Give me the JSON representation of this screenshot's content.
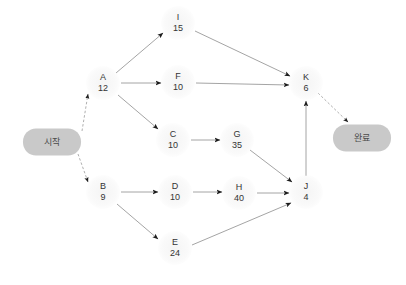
{
  "diagram": {
    "canvas": {
      "width": 406,
      "height": 285,
      "background": "#ffffff"
    },
    "style": {
      "node_fill": "#f4f4f4",
      "terminal_fill": "#c9c9c9",
      "edge_color": "#9a9a9a",
      "arrow_color": "#1a1a1a",
      "text_color": "#343434"
    },
    "start": {
      "id": "start",
      "label": "시작",
      "x": 52,
      "y": 142
    },
    "end": {
      "id": "end",
      "label": "완료",
      "x": 362,
      "y": 138
    },
    "nodes": [
      {
        "id": "A",
        "name": "A",
        "duration": "12",
        "x": 103,
        "y": 83
      },
      {
        "id": "B",
        "name": "B",
        "duration": "9",
        "x": 103,
        "y": 192
      },
      {
        "id": "C",
        "name": "C",
        "duration": "10",
        "x": 173,
        "y": 140
      },
      {
        "id": "D",
        "name": "D",
        "duration": "10",
        "x": 175,
        "y": 192
      },
      {
        "id": "E",
        "name": "E",
        "duration": "24",
        "x": 175,
        "y": 248
      },
      {
        "id": "F",
        "name": "F",
        "duration": "10",
        "x": 178,
        "y": 82
      },
      {
        "id": "G",
        "name": "G",
        "duration": "35",
        "x": 237,
        "y": 140
      },
      {
        "id": "H",
        "name": "H",
        "duration": "40",
        "x": 239,
        "y": 193
      },
      {
        "id": "I",
        "name": "I",
        "duration": "15",
        "x": 178,
        "y": 23
      },
      {
        "id": "J",
        "name": "J",
        "duration": "4",
        "x": 306,
        "y": 192
      },
      {
        "id": "K",
        "name": "K",
        "duration": "6",
        "x": 306,
        "y": 83
      }
    ],
    "edges": [
      {
        "from": "start",
        "to": "A",
        "x1": 82,
        "y1": 131,
        "x2": 88,
        "y2": 94,
        "dashed": true
      },
      {
        "from": "start",
        "to": "B",
        "x1": 78,
        "y1": 154,
        "x2": 88,
        "y2": 182,
        "dashed": true
      },
      {
        "from": "A",
        "to": "I",
        "x1": 116,
        "y1": 73,
        "x2": 163,
        "y2": 33
      },
      {
        "from": "A",
        "to": "F",
        "x1": 121,
        "y1": 83,
        "x2": 161,
        "y2": 83
      },
      {
        "from": "A",
        "to": "C",
        "x1": 118,
        "y1": 95,
        "x2": 158,
        "y2": 129
      },
      {
        "from": "B",
        "to": "D",
        "x1": 121,
        "y1": 192,
        "x2": 158,
        "y2": 192
      },
      {
        "from": "B",
        "to": "E",
        "x1": 117,
        "y1": 204,
        "x2": 158,
        "y2": 239
      },
      {
        "from": "C",
        "to": "G",
        "x1": 191,
        "y1": 140,
        "x2": 220,
        "y2": 140
      },
      {
        "from": "D",
        "to": "H",
        "x1": 193,
        "y1": 192,
        "x2": 222,
        "y2": 192
      },
      {
        "from": "I",
        "to": "K",
        "x1": 195,
        "y1": 31,
        "x2": 290,
        "y2": 76
      },
      {
        "from": "F",
        "to": "K",
        "x1": 196,
        "y1": 83,
        "x2": 289,
        "y2": 85
      },
      {
        "from": "G",
        "to": "J",
        "x1": 250,
        "y1": 150,
        "x2": 292,
        "y2": 182
      },
      {
        "from": "H",
        "to": "J",
        "x1": 257,
        "y1": 193,
        "x2": 289,
        "y2": 193
      },
      {
        "from": "E",
        "to": "J",
        "x1": 192,
        "y1": 245,
        "x2": 291,
        "y2": 203
      },
      {
        "from": "J",
        "to": "K",
        "x1": 306,
        "y1": 176,
        "x2": 306,
        "y2": 101
      },
      {
        "from": "K",
        "to": "end",
        "x1": 318,
        "y1": 93,
        "x2": 348,
        "y2": 122,
        "dashed": true
      }
    ]
  }
}
